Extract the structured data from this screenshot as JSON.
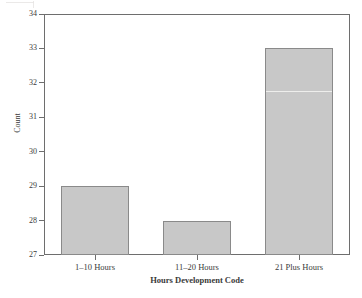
{
  "chart_data": {
    "type": "bar",
    "title": "",
    "xlabel": "Hours Development Code",
    "ylabel": "Count",
    "categories": [
      "1–10 Hours",
      "11–20 Hours",
      "21 Plus Hours"
    ],
    "values": [
      29,
      28,
      33
    ],
    "ylim": [
      27,
      34
    ],
    "yticks": [
      27,
      28,
      29,
      30,
      31,
      32,
      33,
      34
    ],
    "ytick_labels": [
      "27",
      "28",
      "29",
      "30",
      "31",
      "32",
      "33",
      "34"
    ],
    "grid": false,
    "legend": null,
    "bar_color": "#c8c8c8",
    "bar_edge_color": "#8a8a8a",
    "axis_color": "#6e6e6e",
    "background_color": "#ffffff",
    "artifacts": {
      "scan_line_value": 31.75,
      "scan_line_series_index": 2
    }
  }
}
